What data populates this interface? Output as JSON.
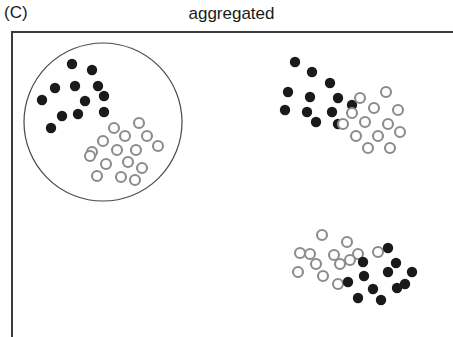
{
  "figure": {
    "panel_label": "(C)",
    "title": "aggregated",
    "width": 453,
    "height": 337,
    "background_color": "#ffffff"
  },
  "frame": {
    "left": 11,
    "top": 31,
    "width": 442,
    "height": 306,
    "axis_color": "#3a3a3a",
    "axis_width": 2,
    "sides_drawn": "left-and-top"
  },
  "colors": {
    "species_a": "#1a1a1a",
    "species_b_stroke": "#8c8c8c",
    "species_b_fill": "#ffffff",
    "sampling_circle": "#4a4a4a",
    "text": "#1a1a1a"
  },
  "legend_semantics": {
    "filled_circle": "species A (filled black point)",
    "open_circle": "species B (open gray point)"
  },
  "sampling_circle": {
    "cx": 103,
    "cy": 122,
    "r": 79,
    "stroke_width": 1.2
  },
  "chart_data": {
    "type": "scatter",
    "title": "aggregated",
    "panel_label": "(C)",
    "xlabel": "",
    "ylabel": "",
    "xlim": [
      11,
      453
    ],
    "ylim": [
      31,
      337
    ],
    "grid": false,
    "legend_position": "none",
    "point_radius_filled": 5.2,
    "point_radius_open": 5.0,
    "annotations": [
      {
        "kind": "sampling-circle",
        "cx": 103,
        "cy": 122,
        "r": 79,
        "encloses": [
          "cluster-1-filled",
          "cluster-1-open"
        ]
      }
    ],
    "series": [
      {
        "name": "species A (filled)",
        "marker": "filled-circle",
        "color": "#1a1a1a",
        "cluster": "cluster-1",
        "points": [
          [
            72,
            64
          ],
          [
            92,
            70
          ],
          [
            55,
            88
          ],
          [
            75,
            86
          ],
          [
            98,
            86
          ],
          [
            104,
            96
          ],
          [
            42,
            100
          ],
          [
            85,
            101
          ],
          [
            62,
            116
          ],
          [
            78,
            114
          ],
          [
            104,
            112
          ],
          [
            51,
            128
          ]
        ]
      },
      {
        "name": "species B (open)",
        "marker": "open-circle",
        "color": "#8c8c8c",
        "cluster": "cluster-1",
        "points": [
          [
            114,
            128
          ],
          [
            139,
            123
          ],
          [
            103,
            141
          ],
          [
            125,
            136
          ],
          [
            147,
            136
          ],
          [
            92,
            152
          ],
          [
            117,
            150
          ],
          [
            136,
            150
          ],
          [
            158,
            146
          ],
          [
            106,
            164
          ],
          [
            128,
            162
          ],
          [
            97,
            176
          ],
          [
            121,
            177
          ],
          [
            142,
            168
          ],
          [
            90,
            156
          ],
          [
            135,
            180
          ]
        ]
      },
      {
        "name": "species A (filled)",
        "marker": "filled-circle",
        "color": "#1a1a1a",
        "cluster": "cluster-2",
        "points": [
          [
            295,
            62
          ],
          [
            312,
            72
          ],
          [
            330,
            83
          ],
          [
            288,
            92
          ],
          [
            310,
            97
          ],
          [
            338,
            98
          ],
          [
            352,
            105
          ],
          [
            285,
            110
          ],
          [
            307,
            112
          ],
          [
            332,
            112
          ],
          [
            316,
            122
          ],
          [
            338,
            124
          ]
        ]
      },
      {
        "name": "species B (open)",
        "marker": "open-circle",
        "color": "#8c8c8c",
        "cluster": "cluster-2",
        "points": [
          [
            360,
            98
          ],
          [
            386,
            92
          ],
          [
            352,
            113
          ],
          [
            374,
            108
          ],
          [
            398,
            110
          ],
          [
            343,
            124
          ],
          [
            365,
            122
          ],
          [
            388,
            124
          ],
          [
            356,
            136
          ],
          [
            378,
            136
          ],
          [
            400,
            132
          ],
          [
            368,
            148
          ],
          [
            390,
            148
          ]
        ]
      },
      {
        "name": "species B (open)",
        "marker": "open-circle",
        "color": "#8c8c8c",
        "cluster": "cluster-3",
        "points": [
          [
            322,
            235
          ],
          [
            347,
            242
          ],
          [
            300,
            253
          ],
          [
            310,
            254
          ],
          [
            334,
            255
          ],
          [
            358,
            254
          ],
          [
            378,
            252
          ],
          [
            316,
            264
          ],
          [
            340,
            264
          ],
          [
            298,
            272
          ],
          [
            323,
            276
          ],
          [
            338,
            284
          ],
          [
            350,
            260
          ]
        ]
      },
      {
        "name": "species A (filled)",
        "marker": "filled-circle",
        "color": "#1a1a1a",
        "cluster": "cluster-3",
        "points": [
          [
            388,
            248
          ],
          [
            396,
            263
          ],
          [
            364,
            276
          ],
          [
            388,
            272
          ],
          [
            412,
            272
          ],
          [
            373,
            289
          ],
          [
            397,
            288
          ],
          [
            358,
            298
          ],
          [
            381,
            300
          ],
          [
            348,
            282
          ],
          [
            405,
            284
          ],
          [
            363,
            262
          ]
        ]
      }
    ]
  }
}
